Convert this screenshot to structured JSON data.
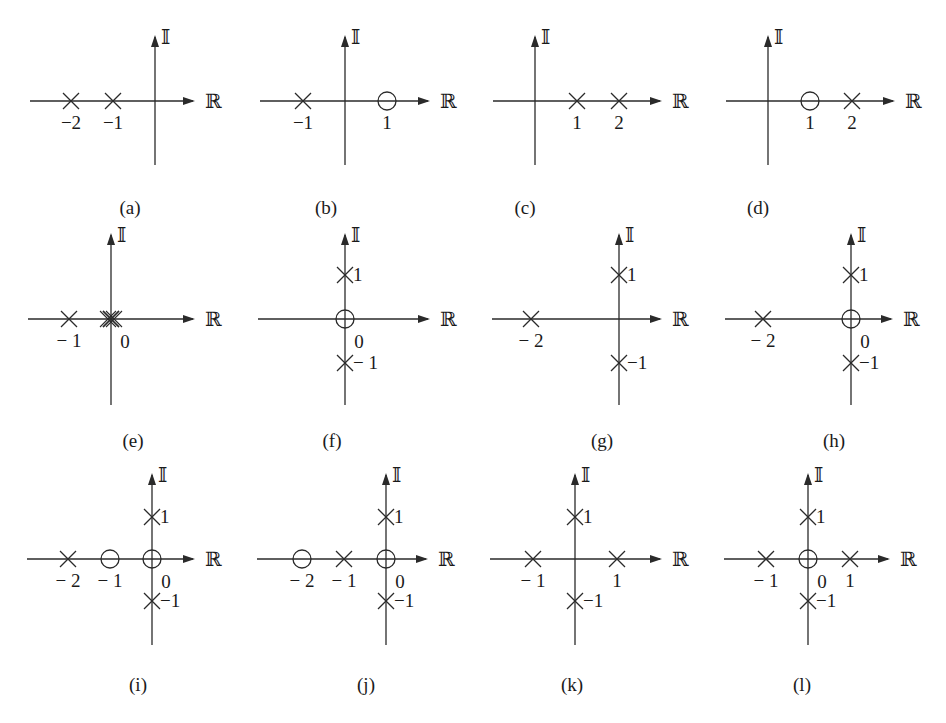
{
  "figure": {
    "axis_labels": {
      "real": "ℝ",
      "imag": "𝕀"
    },
    "legend": {
      "pole_marker": "×",
      "zero_marker": "○"
    },
    "panels": [
      {
        "id": "a",
        "caption": "(a)",
        "origin": [
          155,
          101
        ],
        "unit": 42,
        "h": [
          30,
          195
        ],
        "v": [
          35,
          165
        ],
        "poles": [
          [
            -2,
            0
          ],
          [
            -1,
            0
          ]
        ],
        "zeros": [],
        "tick_labels": [
          {
            "text": "−2",
            "at": [
              -2,
              0
            ],
            "pos": "below"
          },
          {
            "text": "−1",
            "at": [
              -1,
              0
            ],
            "pos": "below"
          }
        ]
      },
      {
        "id": "b",
        "caption": "(b)",
        "origin": [
          345,
          101
        ],
        "unit": 42,
        "h": [
          260,
          430
        ],
        "v": [
          35,
          165
        ],
        "poles": [
          [
            -1,
            0
          ]
        ],
        "zeros": [
          [
            1,
            0
          ]
        ],
        "tick_labels": [
          {
            "text": "−1",
            "at": [
              -1,
              0
            ],
            "pos": "below"
          },
          {
            "text": "1",
            "at": [
              1,
              0
            ],
            "pos": "below"
          }
        ]
      },
      {
        "id": "c",
        "caption": "(c)",
        "origin": [
          535,
          101
        ],
        "unit": 42,
        "h": [
          493,
          662
        ],
        "v": [
          35,
          165
        ],
        "poles": [
          [
            1,
            0
          ],
          [
            2,
            0
          ]
        ],
        "zeros": [],
        "tick_labels": [
          {
            "text": "1",
            "at": [
              1,
              0
            ],
            "pos": "below"
          },
          {
            "text": "2",
            "at": [
              2,
              0
            ],
            "pos": "below"
          }
        ]
      },
      {
        "id": "d",
        "caption": "(d)",
        "origin": [
          768,
          101
        ],
        "unit": 42,
        "h": [
          726,
          895
        ],
        "v": [
          35,
          165
        ],
        "poles": [
          [
            2,
            0
          ]
        ],
        "zeros": [
          [
            1,
            0
          ]
        ],
        "tick_labels": [
          {
            "text": "1",
            "at": [
              1,
              0
            ],
            "pos": "below"
          },
          {
            "text": "2",
            "at": [
              2,
              0
            ],
            "pos": "below"
          }
        ]
      },
      {
        "id": "e",
        "caption": "(e)",
        "origin": [
          111,
          319
        ],
        "unit": 42,
        "h": [
          28,
          195
        ],
        "v": [
          233,
          405
        ],
        "poles": [
          [
            -1,
            0
          ],
          [
            0,
            0
          ],
          [
            0,
            0
          ]
        ],
        "double_pole_at_origin": true,
        "zeros": [],
        "tick_labels": [
          {
            "text": "− 1",
            "at": [
              -1,
              0
            ],
            "pos": "below"
          },
          {
            "text": "0",
            "at": [
              0,
              0
            ],
            "pos": "below-right"
          }
        ]
      },
      {
        "id": "f",
        "caption": "(f)",
        "origin": [
          345,
          319
        ],
        "unit": 44,
        "h": [
          258,
          430
        ],
        "v": [
          233,
          405
        ],
        "poles": [
          [
            0,
            1
          ],
          [
            0,
            -1
          ]
        ],
        "zeros": [
          [
            0,
            0
          ]
        ],
        "tick_labels": [
          {
            "text": "1",
            "at": [
              0,
              1
            ],
            "pos": "right"
          },
          {
            "text": "0",
            "at": [
              0,
              0
            ],
            "pos": "below-right"
          },
          {
            "text": "− 1",
            "at": [
              0,
              -1
            ],
            "pos": "right"
          }
        ]
      },
      {
        "id": "g",
        "caption": "(g)",
        "origin": [
          619,
          319
        ],
        "unit": 44,
        "h": [
          492,
          662
        ],
        "v": [
          233,
          405
        ],
        "poles": [
          [
            -6,
            0
          ],
          [
            0,
            1
          ],
          [
            0,
            -1
          ]
        ],
        "real_positions": {
          "-6": "-2"
        },
        "zeros": [],
        "tick_labels": [
          {
            "text": "− 2",
            "at": [
              -6,
              0
            ],
            "pos": "below"
          },
          {
            "text": "1",
            "at": [
              0,
              1
            ],
            "pos": "right"
          },
          {
            "text": "−1",
            "at": [
              0,
              -1
            ],
            "pos": "right"
          }
        ]
      },
      {
        "id": "h",
        "caption": "(h)",
        "origin": [
          851,
          319
        ],
        "unit": 44,
        "h": [
          725,
          893
        ],
        "v": [
          233,
          405
        ],
        "poles": [
          [
            -6,
            0
          ],
          [
            0,
            1
          ],
          [
            0,
            -1
          ]
        ],
        "real_positions": {
          "-6": "-2"
        },
        "zeros": [
          [
            0,
            0
          ]
        ],
        "tick_labels": [
          {
            "text": "− 2",
            "at": [
              -6,
              0
            ],
            "pos": "below"
          },
          {
            "text": "1",
            "at": [
              0,
              1
            ],
            "pos": "right"
          },
          {
            "text": "0",
            "at": [
              0,
              0
            ],
            "pos": "below-right"
          },
          {
            "text": "−1",
            "at": [
              0,
              -1
            ],
            "pos": "right"
          }
        ]
      },
      {
        "id": "i",
        "caption": "(i)",
        "origin": [
          152,
          559
        ],
        "unit": 42,
        "h": [
          27,
          195
        ],
        "v": [
          473,
          645
        ],
        "poles": [
          [
            -2,
            0
          ],
          [
            0,
            1
          ],
          [
            0,
            -1
          ]
        ],
        "zeros": [
          [
            -1,
            0
          ],
          [
            0,
            0
          ]
        ],
        "tick_labels": [
          {
            "text": "− 2",
            "at": [
              -2,
              0
            ],
            "pos": "below"
          },
          {
            "text": "− 1",
            "at": [
              -1,
              0
            ],
            "pos": "below"
          },
          {
            "text": "1",
            "at": [
              0,
              1
            ],
            "pos": "right"
          },
          {
            "text": "0",
            "at": [
              0,
              0
            ],
            "pos": "below-right"
          },
          {
            "text": "−1",
            "at": [
              0,
              -1
            ],
            "pos": "right"
          }
        ]
      },
      {
        "id": "j",
        "caption": "(j)",
        "origin": [
          386,
          559
        ],
        "unit": 42,
        "h": [
          257,
          428
        ],
        "v": [
          473,
          645
        ],
        "poles": [
          [
            -1,
            0
          ],
          [
            0,
            1
          ],
          [
            0,
            -1
          ]
        ],
        "zeros": [
          [
            -2,
            0
          ],
          [
            0,
            0
          ]
        ],
        "tick_labels": [
          {
            "text": "− 2",
            "at": [
              -2,
              0
            ],
            "pos": "below"
          },
          {
            "text": "− 1",
            "at": [
              -1,
              0
            ],
            "pos": "below"
          },
          {
            "text": "1",
            "at": [
              0,
              1
            ],
            "pos": "right"
          },
          {
            "text": "0",
            "at": [
              0,
              0
            ],
            "pos": "below-right"
          },
          {
            "text": "−1",
            "at": [
              0,
              -1
            ],
            "pos": "right"
          }
        ]
      },
      {
        "id": "k",
        "caption": "(k)",
        "origin": [
          575,
          559
        ],
        "unit": 42,
        "h": [
          490,
          662
        ],
        "v": [
          473,
          645
        ],
        "poles": [
          [
            -1,
            0
          ],
          [
            1,
            0
          ],
          [
            0,
            1
          ],
          [
            0,
            -1
          ]
        ],
        "zeros": [],
        "tick_labels": [
          {
            "text": "− 1",
            "at": [
              -1,
              0
            ],
            "pos": "below"
          },
          {
            "text": "1",
            "at": [
              1,
              0
            ],
            "pos": "below"
          },
          {
            "text": "1",
            "at": [
              0,
              1
            ],
            "pos": "right"
          },
          {
            "text": "−1",
            "at": [
              0,
              -1
            ],
            "pos": "right"
          }
        ]
      },
      {
        "id": "l",
        "caption": "(l)",
        "origin": [
          808,
          559
        ],
        "unit": 42,
        "h": [
          724,
          890
        ],
        "v": [
          473,
          645
        ],
        "poles": [
          [
            -1,
            0
          ],
          [
            1,
            0
          ],
          [
            0,
            1
          ],
          [
            0,
            -1
          ]
        ],
        "zeros": [
          [
            0,
            0
          ]
        ],
        "tick_labels": [
          {
            "text": "− 1",
            "at": [
              -1,
              0
            ],
            "pos": "below"
          },
          {
            "text": "0",
            "at": [
              0,
              0
            ],
            "pos": "below-right"
          },
          {
            "text": "1",
            "at": [
              1,
              0
            ],
            "pos": "below"
          },
          {
            "text": "1",
            "at": [
              0,
              1
            ],
            "pos": "right"
          },
          {
            "text": "−1",
            "at": [
              0,
              -1
            ],
            "pos": "right"
          }
        ]
      }
    ]
  }
}
